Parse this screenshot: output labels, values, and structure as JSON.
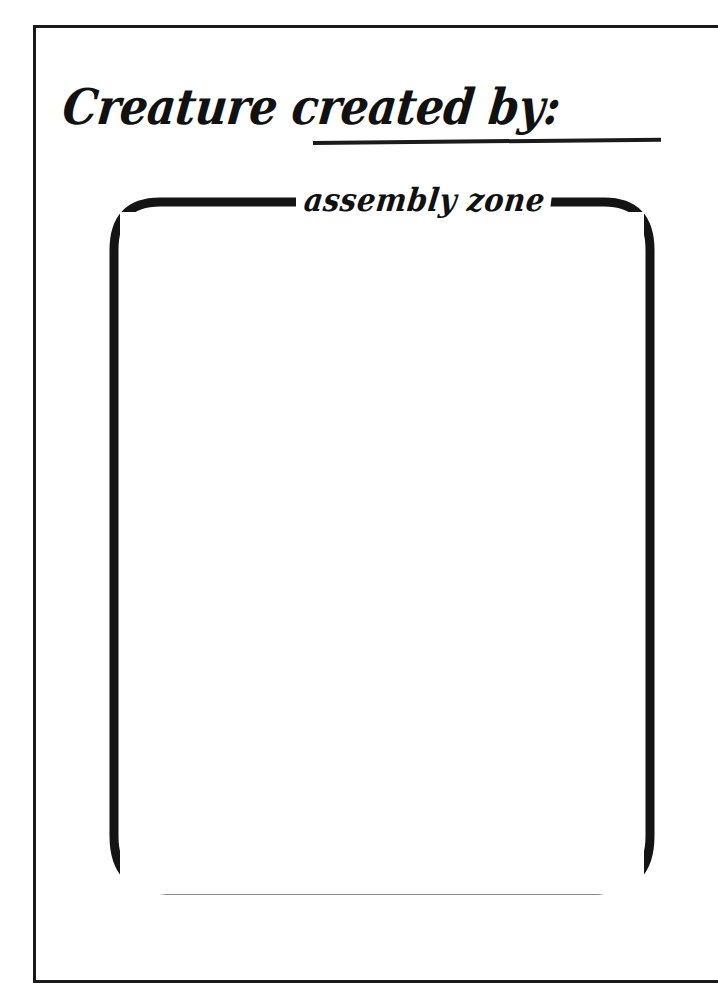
{
  "page": {
    "background_color": "#ffffff",
    "ink_color": "#1b1b1b"
  },
  "frame": {
    "name": "page-border",
    "style": "thin rectangular rule"
  },
  "heading": {
    "prompt_text": "Creature created by:",
    "blank_line_label": "",
    "blank_value": ""
  },
  "assembly_zone": {
    "label": "assembly  zone",
    "contents": "",
    "placeholder": ""
  }
}
